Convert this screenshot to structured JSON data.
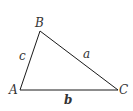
{
  "diagram": {
    "type": "triangle",
    "stroke_color": "#1a1a1a",
    "vertices": [
      {
        "name": "A",
        "label": "A",
        "x": 20,
        "y": 90
      },
      {
        "name": "B",
        "label": "B",
        "x": 40,
        "y": 31
      },
      {
        "name": "C",
        "label": "C",
        "x": 118,
        "y": 90
      }
    ],
    "sides": [
      {
        "name": "a",
        "label": "a",
        "between": [
          "B",
          "C"
        ],
        "bold": false
      },
      {
        "name": "b",
        "label": "b",
        "between": [
          "A",
          "C"
        ],
        "bold": true
      },
      {
        "name": "c",
        "label": "c",
        "between": [
          "A",
          "B"
        ],
        "bold": false
      }
    ]
  }
}
